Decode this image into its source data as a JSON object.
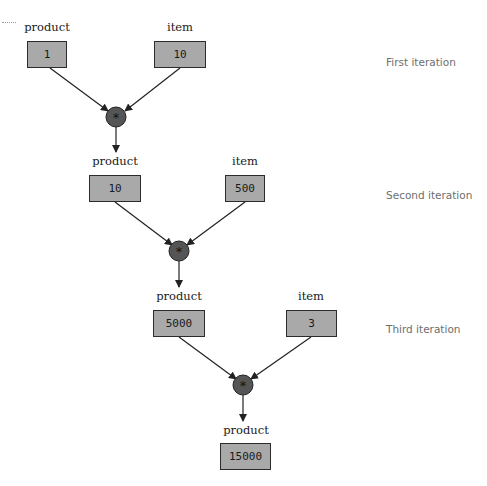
{
  "diagram": {
    "iterations": [
      {
        "label": "First iteration",
        "product_label": "product",
        "product_value": "1",
        "item_label": "item",
        "item_value": "10",
        "operator": "*",
        "result_label": "product"
      },
      {
        "label": "Second iteration",
        "product_label": "product",
        "product_value": "10",
        "item_label": "item",
        "item_value": "500",
        "operator": "*",
        "result_label": "product"
      },
      {
        "label": "Third iteration",
        "product_label": "product",
        "product_value": "5000",
        "item_label": "item",
        "item_value": "3",
        "operator": "*",
        "result_label": "product"
      }
    ],
    "final": {
      "label": "product",
      "value": "15000"
    },
    "colors": {
      "box_fill": "#a9a9a9",
      "box_border": "#2b2b2b",
      "operator_fill": "#555555",
      "arrow": "#222222",
      "iteration_text": "#6e6e6e"
    }
  }
}
